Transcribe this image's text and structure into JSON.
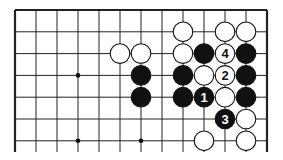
{
  "diagram": {
    "type": "go-board-fragment",
    "grid": {
      "cols": 13,
      "x0": 15,
      "dx": 21.0,
      "rows": 7,
      "y0": 10,
      "dy": 21.8,
      "open_bottom": true,
      "bottom_extent": 152
    },
    "star_points": [
      [
        3,
        3
      ],
      [
        3,
        6
      ],
      [
        6,
        6
      ]
    ],
    "stones": [
      {
        "c": 8,
        "r": 1,
        "color": "white",
        "label": ""
      },
      {
        "c": 10,
        "r": 1,
        "color": "white",
        "label": ""
      },
      {
        "c": 11,
        "r": 1,
        "color": "white",
        "label": ""
      },
      {
        "c": 5,
        "r": 2,
        "color": "white",
        "label": ""
      },
      {
        "c": 6,
        "r": 2,
        "color": "white",
        "label": ""
      },
      {
        "c": 8,
        "r": 2,
        "color": "white",
        "label": ""
      },
      {
        "c": 9,
        "r": 2,
        "color": "black",
        "label": ""
      },
      {
        "c": 10,
        "r": 2,
        "color": "white",
        "label": "4"
      },
      {
        "c": 11,
        "r": 2,
        "color": "black",
        "label": ""
      },
      {
        "c": 6,
        "r": 3,
        "color": "black",
        "label": ""
      },
      {
        "c": 8,
        "r": 3,
        "color": "black",
        "label": ""
      },
      {
        "c": 9,
        "r": 3,
        "color": "white",
        "label": ""
      },
      {
        "c": 10,
        "r": 3,
        "color": "white",
        "label": "2"
      },
      {
        "c": 11,
        "r": 3,
        "color": "black",
        "label": ""
      },
      {
        "c": 6,
        "r": 4,
        "color": "black",
        "label": ""
      },
      {
        "c": 8,
        "r": 4,
        "color": "black",
        "label": ""
      },
      {
        "c": 9,
        "r": 4,
        "color": "black",
        "label": "1"
      },
      {
        "c": 10,
        "r": 4,
        "color": "white",
        "label": ""
      },
      {
        "c": 11,
        "r": 4,
        "color": "black",
        "label": ""
      },
      {
        "c": 10,
        "r": 5,
        "color": "black",
        "label": "3"
      },
      {
        "c": 11,
        "r": 5,
        "color": "white",
        "label": ""
      },
      {
        "c": 9,
        "r": 6,
        "color": "white",
        "label": ""
      },
      {
        "c": 11,
        "r": 6,
        "color": "white",
        "label": ""
      }
    ]
  }
}
